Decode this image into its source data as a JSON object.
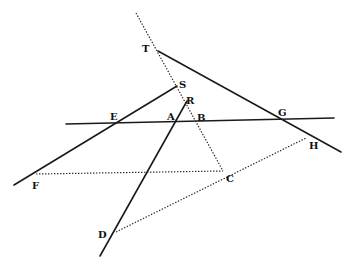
{
  "diagram": {
    "type": "geometric-construction",
    "points": {
      "T": {
        "label": "T",
        "x": 158,
        "y": 51,
        "lx": 142,
        "ly": 52
      },
      "S": {
        "label": "S",
        "x": 177,
        "y": 86,
        "lx": 179,
        "ly": 88
      },
      "R": {
        "label": "R",
        "x": 187,
        "y": 101,
        "lx": 186,
        "ly": 104
      },
      "A": {
        "label": "A",
        "x": 177,
        "y": 124,
        "lx": 167,
        "ly": 120
      },
      "B": {
        "label": "B",
        "x": 197,
        "y": 124,
        "lx": 197,
        "ly": 121
      },
      "E": {
        "label": "E",
        "x": 114,
        "y": 124,
        "lx": 110,
        "ly": 120
      },
      "G": {
        "label": "G",
        "x": 283,
        "y": 121,
        "lx": 278,
        "ly": 116
      },
      "H": {
        "label": "H",
        "x": 306,
        "y": 138,
        "lx": 309,
        "ly": 149
      },
      "F": {
        "label": "F",
        "x": 36,
        "y": 174,
        "lx": 32,
        "ly": 189
      },
      "C": {
        "label": "C",
        "x": 223,
        "y": 171,
        "lx": 226,
        "ly": 182
      },
      "D": {
        "label": "D",
        "x": 116,
        "y": 232,
        "lx": 98,
        "ly": 238
      }
    },
    "solid_lines": [
      {
        "name": "line-horizontal-EG",
        "x1": 66,
        "y1": 124,
        "x2": 334,
        "y2": 118
      },
      {
        "name": "line-TG",
        "x1": 158,
        "y1": 51,
        "x2": 341,
        "y2": 152
      },
      {
        "name": "line-FS",
        "x1": 14,
        "y1": 185,
        "x2": 177,
        "y2": 86
      },
      {
        "name": "line-RD",
        "x1": 187,
        "y1": 101,
        "x2": 100,
        "y2": 256
      }
    ],
    "dotted_lines": [
      {
        "name": "line-top-to-C",
        "x1": 136,
        "y1": 13,
        "x2": 223,
        "y2": 171
      },
      {
        "name": "line-FC",
        "x1": 36,
        "y1": 174,
        "x2": 223,
        "y2": 171
      },
      {
        "name": "line-DH",
        "x1": 116,
        "y1": 232,
        "x2": 306,
        "y2": 138
      }
    ]
  }
}
